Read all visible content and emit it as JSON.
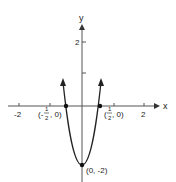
{
  "figure": {
    "axes": {
      "x_label": "x",
      "y_label": "y",
      "x_ticks": [
        {
          "value": -2,
          "label": "-2"
        },
        {
          "value": -1,
          "label": ""
        },
        {
          "value": 1,
          "label": ""
        },
        {
          "value": 2,
          "label": "2"
        }
      ],
      "y_ticks": [
        {
          "value": 1,
          "label": ""
        },
        {
          "value": 2,
          "label": "2"
        }
      ]
    },
    "points": [
      {
        "x": -0.5,
        "y": 0,
        "label_prefix": "(-",
        "label_num": "1",
        "label_den": "2",
        "label_suffix": ", 0)"
      },
      {
        "x": 0.5,
        "y": 0,
        "label_prefix": "(",
        "label_num": "1",
        "label_den": "2",
        "label_suffix": ", 0)"
      },
      {
        "x": 0,
        "y": -2,
        "label": "(0, -2)"
      }
    ],
    "colors": {
      "stroke": "#222222",
      "axis": "#555555"
    }
  }
}
